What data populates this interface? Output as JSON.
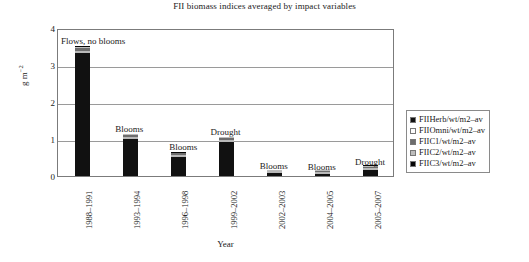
{
  "chart_data": {
    "type": "bar",
    "subtype": "stacked-bar",
    "title": "FII biomass indices averaged by impact variables",
    "xlabel": "Year",
    "ylabel": "g m−2",
    "ylim": [
      0,
      4
    ],
    "yticks": [
      "0",
      "1",
      "2",
      "3",
      "4"
    ],
    "grid": true,
    "legend_position": "right",
    "categories": [
      "1988–1991",
      "1993–1994",
      "1996–1998",
      "1999–2002",
      "2002–2003",
      "2004–2005",
      "2005–2007"
    ],
    "annotations": [
      "Flows, no blooms",
      "Blooms",
      "Blooms",
      "Drought",
      "Blooms",
      "Blooms",
      "Drought"
    ],
    "series": [
      {
        "name": "FIIHerb/wt/m2–av",
        "color": "#111111",
        "values": [
          3.32,
          1.0,
          0.52,
          0.92,
          0.07,
          0.06,
          0.17
        ]
      },
      {
        "name": "FIIOmni/wt/m2–av",
        "color": "#fdfdfd",
        "values": [
          0.04,
          0.02,
          0.02,
          0.02,
          0.01,
          0.01,
          0.01
        ]
      },
      {
        "name": "FIIC1/wt/m2–av",
        "color": "#6d6d6d",
        "values": [
          0.08,
          0.05,
          0.04,
          0.05,
          0.01,
          0.01,
          0.02
        ]
      },
      {
        "name": "FIIC2/wt/m2–av",
        "color": "#bdbdbd",
        "values": [
          0.04,
          0.02,
          0.02,
          0.02,
          0.01,
          0.01,
          0.01
        ]
      },
      {
        "name": "FIIC3/wt/m2–av",
        "color": "#050505",
        "values": [
          0.02,
          0.01,
          0.01,
          0.01,
          0.0,
          0.0,
          0.01
        ]
      }
    ],
    "totals": [
      3.5,
      1.1,
      0.61,
      1.02,
      0.1,
      0.09,
      0.22
    ]
  }
}
